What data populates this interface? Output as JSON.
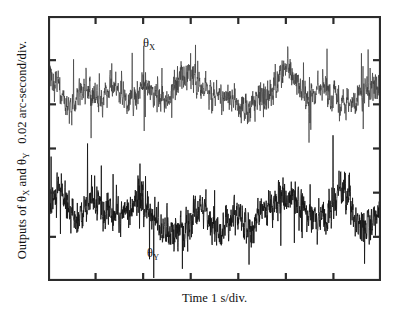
{
  "figure": {
    "background_color": "#ffffff",
    "frame_color": "#2b2b2b"
  },
  "axes": {
    "ylabel_prefix": "Outputs of ",
    "ylabel_theta1": "θ",
    "ylabel_theta1_sub": "X",
    "ylabel_and": " and ",
    "ylabel_theta2": "θ",
    "ylabel_theta2_sub": "Y",
    "ylabel_units": "0.02 arc-second/div.",
    "xlabel": "Time  1 s/div."
  },
  "curve_labels": {
    "theta_x": "θ",
    "theta_x_sub": "X",
    "theta_y": "θ",
    "theta_y_sub": "Y"
  },
  "chart_data": {
    "type": "line",
    "title": "",
    "subtitle": "",
    "xlabel": "Time  1 s/div.",
    "ylabel": "Outputs of θX and θY  0.02 arc-second/div.",
    "grid": false,
    "legend": "inline-annotations",
    "x_tick_labels": [],
    "y_tick_labels": [],
    "x_divisions": 7,
    "y_divisions": 6,
    "x_unit_per_division": "1 s",
    "y_unit_per_division": "0.02 arc-second",
    "xlim": [
      0,
      7
    ],
    "ylim": [
      0,
      6
    ],
    "annotations": [
      {
        "text": "θX",
        "x_frac": 0.295,
        "y_frac": 0.078
      },
      {
        "text": "θY",
        "x_frac": 0.305,
        "y_frac": 0.872
      }
    ],
    "series": [
      {
        "name": "θX",
        "color": "#3a3a3a",
        "baseline_y_frac": 0.287,
        "noise_amplitude_divisions": 0.62,
        "samples": 1500,
        "description": "Broadband random noise trace, mean-centered in upper half of frame, occasional spikes to about 1.4 divisions peak"
      },
      {
        "name": "θY",
        "color": "#141414",
        "baseline_y_frac": 0.751,
        "noise_amplitude_divisions": 0.72,
        "samples": 1500,
        "description": "Broadband random noise trace, denser and darker, mean-centered in lower half of frame, occasional spikes to about 1.6 divisions peak"
      }
    ]
  }
}
